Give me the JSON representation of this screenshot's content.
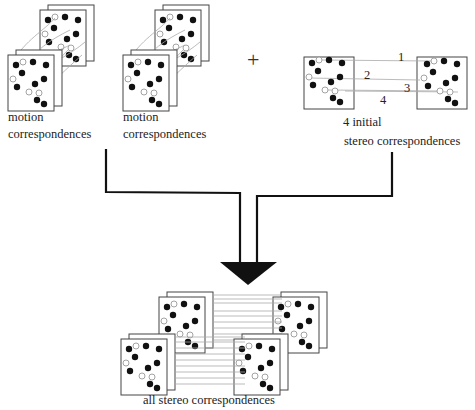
{
  "diagram": {
    "inputs": [
      {
        "id": "motion-1",
        "label_line1": "motion",
        "label_line2": "correspondences"
      },
      {
        "id": "motion-2",
        "label_line1": "motion",
        "label_line2": "correspondences"
      },
      {
        "id": "stereo-initial",
        "label_line1": "4 initial",
        "label_line2": "stereo correspondences"
      }
    ],
    "operator": "+",
    "stereo_numbers": [
      "1",
      "2",
      "3",
      "4"
    ],
    "output": {
      "label": "all stereo correspondences"
    },
    "colors": {
      "line": "#111111",
      "frame": "#444444",
      "correspondence": "#aaaaaa"
    }
  }
}
